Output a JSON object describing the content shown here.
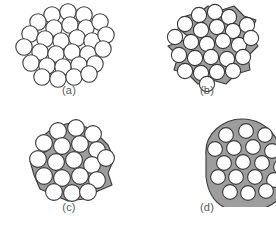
{
  "figure": {
    "background_color": "#ffffff",
    "outline_color": "#3a3a3a",
    "particle_fill": "#ffffff",
    "matrix_fill": "#9d9d9d",
    "label_color": "#58585a"
  },
  "panels": [
    {
      "id": "a",
      "label": "(a)",
      "caption": "Loose powder particles in point contact, no neck growth",
      "stage": "green compact",
      "matrix": false,
      "particle_count": 29,
      "particle_radius": 8.2,
      "particles": [
        [
          52,
          15
        ],
        [
          68,
          12
        ],
        [
          84,
          15
        ],
        [
          38,
          22
        ],
        [
          54,
          28
        ],
        [
          70,
          25
        ],
        [
          86,
          28
        ],
        [
          100,
          22
        ],
        [
          30,
          34
        ],
        [
          45,
          39
        ],
        [
          61,
          41
        ],
        [
          77,
          38
        ],
        [
          92,
          41
        ],
        [
          106,
          35
        ],
        [
          24,
          47
        ],
        [
          40,
          52
        ],
        [
          56,
          54
        ],
        [
          72,
          52
        ],
        [
          88,
          54
        ],
        [
          103,
          49
        ],
        [
          31,
          63
        ],
        [
          47,
          66
        ],
        [
          63,
          67
        ],
        [
          79,
          65
        ],
        [
          95,
          64
        ],
        [
          42,
          77
        ],
        [
          58,
          79
        ],
        [
          74,
          77
        ],
        [
          89,
          74
        ]
      ]
    },
    {
      "id": "b",
      "label": "(b)",
      "caption": "Initial stage: neck formation between adjacent particles",
      "stage": "initial sintering",
      "matrix": true,
      "particle_count": 24,
      "particle_radius": 7.6,
      "matrix_path": "M 52 38 L 40 28 L 48 16 L 62 12 L 70 6 L 84 10 L 96 6 L 106 16 L 118 20 L 112 34 L 120 46 L 110 56 L 112 70 L 98 74 L 88 84 L 74 80 L 60 84 L 50 74 L 36 70 L 40 56 L 30 46 Z",
      "particles": [
        [
          61,
          15
        ],
        [
          77,
          12
        ],
        [
          91,
          17
        ],
        [
          47,
          24
        ],
        [
          63,
          30
        ],
        [
          79,
          27
        ],
        [
          95,
          31
        ],
        [
          109,
          25
        ],
        [
          37,
          37
        ],
        [
          53,
          42
        ],
        [
          69,
          44
        ],
        [
          85,
          41
        ],
        [
          101,
          45
        ],
        [
          113,
          38
        ],
        [
          41,
          55
        ],
        [
          57,
          58
        ],
        [
          73,
          57
        ],
        [
          89,
          59
        ],
        [
          105,
          57
        ],
        [
          47,
          71
        ],
        [
          63,
          73
        ],
        [
          79,
          72
        ],
        [
          95,
          71
        ],
        [
          69,
          84
        ]
      ]
    },
    {
      "id": "c",
      "label": "(c)",
      "caption": "Intermediate stage: pore channels shrink, grain growth proceeds",
      "stage": "intermediate sintering",
      "matrix": true,
      "particle_count": 19,
      "particle_radius": 8.4,
      "matrix_path": "M 50 34 L 42 22 L 54 12 L 70 8 L 86 12 L 98 20 L 108 30 L 114 44 L 108 58 L 112 70 L 98 76 L 84 84 L 68 86 L 54 80 L 40 74 L 34 60 L 30 46 Z",
      "particles": [
        [
          58,
          16
        ],
        [
          76,
          13
        ],
        [
          93,
          19
        ],
        [
          44,
          28
        ],
        [
          62,
          31
        ],
        [
          80,
          29
        ],
        [
          97,
          35
        ],
        [
          38,
          44
        ],
        [
          56,
          47
        ],
        [
          74,
          45
        ],
        [
          92,
          50
        ],
        [
          106,
          43
        ],
        [
          44,
          61
        ],
        [
          62,
          63
        ],
        [
          80,
          61
        ],
        [
          97,
          65
        ],
        [
          54,
          77
        ],
        [
          72,
          78
        ],
        [
          88,
          77
        ]
      ]
    },
    {
      "id": "d",
      "label": "(d)",
      "caption": "Final stage: isolated spherical pores within a dense solid",
      "stage": "final sintering",
      "matrix": true,
      "particle_count": 18,
      "particle_radius": 7.4,
      "matrix_path": "M 68 40 C 66 18 86 4 104 4 C 122 4 134 14 142 30 C 150 44 166 48 166 58 C 166 68 150 70 144 80 C 136 92 118 98 100 96 C 78 94 70 78 68 62 Z",
      "particles": [
        [
          88,
          20
        ],
        [
          108,
          16
        ],
        [
          127,
          20
        ],
        [
          77,
          34
        ],
        [
          96,
          33
        ],
        [
          115,
          32
        ],
        [
          134,
          36
        ],
        [
          86,
          48
        ],
        [
          105,
          47
        ],
        [
          124,
          48
        ],
        [
          143,
          52
        ],
        [
          80,
          62
        ],
        [
          98,
          62
        ],
        [
          117,
          62
        ],
        [
          136,
          65
        ],
        [
          92,
          77
        ],
        [
          110,
          78
        ],
        [
          128,
          76
        ]
      ]
    }
  ]
}
